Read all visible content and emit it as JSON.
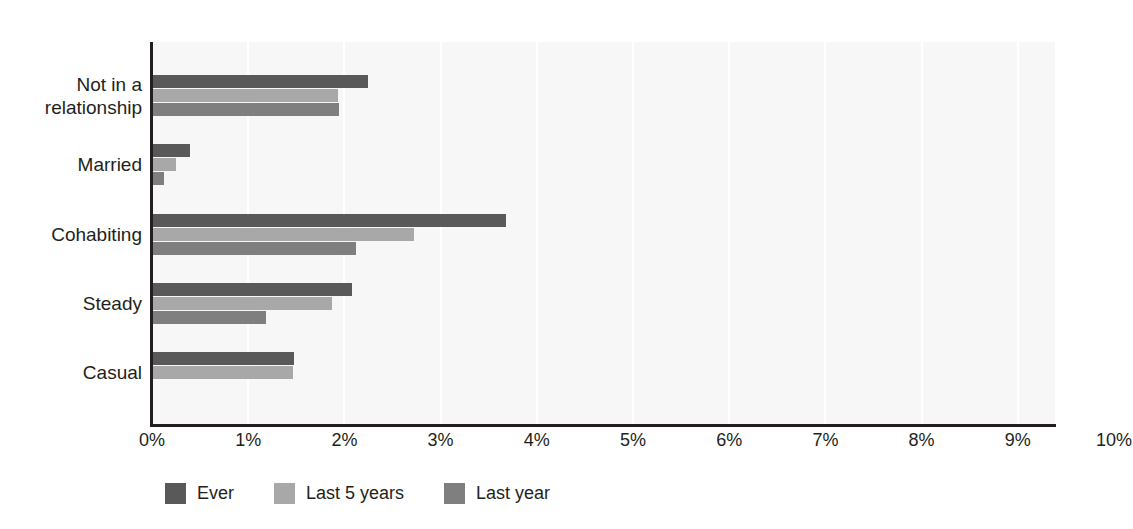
{
  "chart_data": {
    "type": "bar",
    "orientation": "horizontal",
    "title": "",
    "xlabel": "",
    "ylabel": "",
    "xlim": [
      0,
      10
    ],
    "xtick_labels": [
      "0%",
      "1%",
      "2%",
      "3%",
      "4%",
      "5%",
      "6%",
      "7%",
      "8%",
      "9%",
      "10%"
    ],
    "xtick_values": [
      0,
      1,
      2,
      3,
      4,
      5,
      6,
      7,
      8,
      9,
      10
    ],
    "grid": "vertical-only",
    "legend_position": "bottom-left",
    "categories": [
      "Not in a\nrelationship",
      "Married",
      "Cohabiting",
      "Steady",
      "Casual"
    ],
    "series": [
      {
        "name": "Ever",
        "color": "#595959",
        "values": [
          2.25,
          0.4,
          3.68,
          2.08,
          1.48
        ]
      },
      {
        "name": "Last 5 years",
        "color": "#a8a8a8",
        "values": [
          1.93,
          0.25,
          2.72,
          1.87,
          1.47
        ]
      },
      {
        "name": "Last year",
        "color": "#7f7f7f",
        "values": [
          1.94,
          0.12,
          2.12,
          1.18,
          0
        ]
      }
    ]
  },
  "legend": {
    "items": [
      {
        "label": "Ever",
        "color": "#595959"
      },
      {
        "label": "Last 5 years",
        "color": "#a8a8a8"
      },
      {
        "label": "Last year",
        "color": "#7f7f7f"
      }
    ]
  }
}
